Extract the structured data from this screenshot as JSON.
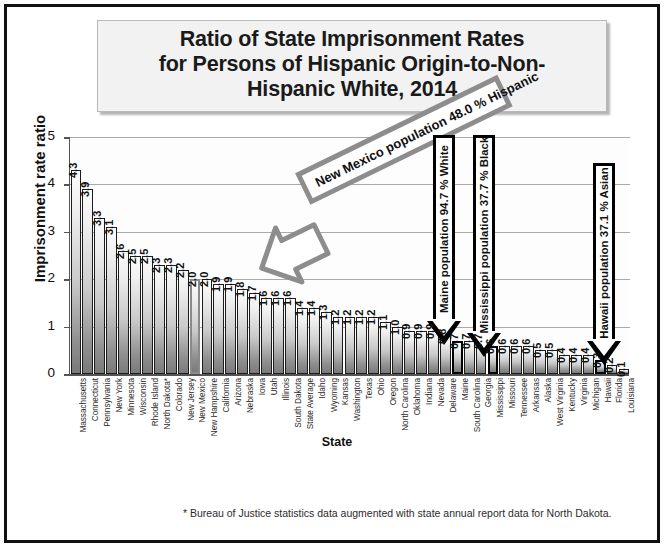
{
  "title": {
    "line1": "Ratio of State Imprisonment Rates",
    "line2": "for Persons of Hispanic Origin-to-Non-",
    "line3": "Hispanic White, 2014"
  },
  "footnote": "* Bureau of Justice statistics data augmented with state annual report data for North Dakota.",
  "annotations": {
    "new_mexico": "New Mexico population 48.0 % Hispanic",
    "maine": "Maine population 94.7 % White",
    "mississippi": "Mississippi population 37.7 % Black",
    "hawaii": "Hawaii population 37.1 % Asian"
  },
  "chart_data": {
    "type": "bar",
    "xlabel": "State",
    "ylabel": "Imprisonment rate ratio",
    "ylim": [
      0,
      5
    ],
    "yticks": [
      0,
      1,
      2,
      3,
      4,
      5
    ],
    "grid": true,
    "legend": "none",
    "categories": [
      "Massachusetts",
      "Connecticut",
      "Pennsylvania",
      "New York",
      "Minnesota",
      "Wisconsin",
      "Rhode Island",
      "North Dakota*",
      "Colorado",
      "New Jersey",
      "New Mexico",
      "New Hampshire",
      "California",
      "Arizona",
      "Nebraska",
      "Iowa",
      "Utah",
      "Illinois",
      "South Dakota",
      "State Average",
      "Idaho",
      "Wyoming",
      "Kansas",
      "Washington",
      "Texas",
      "Ohio",
      "Oregon",
      "North Carolina",
      "Oklahoma",
      "Indiana",
      "Nevada",
      "Delaware",
      "Maine",
      "South Carolina",
      "Georgia",
      "Mississippi",
      "Missouri",
      "Tennessee",
      "Arkansas",
      "Alaska",
      "West Virginia",
      "Kentucky",
      "Virginia",
      "Michigan",
      "Hawaii",
      "Florida",
      "Louisiana"
    ],
    "values": [
      4.3,
      3.9,
      3.3,
      3.1,
      2.6,
      2.5,
      2.5,
      2.3,
      2.3,
      2.2,
      2.0,
      2.0,
      1.9,
      1.9,
      1.8,
      1.7,
      1.6,
      1.6,
      1.6,
      1.4,
      1.4,
      1.3,
      1.2,
      1.2,
      1.2,
      1.2,
      1.1,
      1.0,
      0.9,
      0.9,
      0.9,
      0.8,
      0.7,
      0.7,
      0.7,
      0.6,
      0.6,
      0.6,
      0.6,
      0.5,
      0.5,
      0.4,
      0.4,
      0.4,
      0.3,
      0.2,
      0.1
    ],
    "highlighted": {
      "New Mexico": "gray-outline",
      "Maine": "black-outline",
      "Mississippi": "black-outline",
      "Hawaii": "black-outline"
    },
    "annotations": [
      "New Mexico population 48.0 % Hispanic",
      "Maine population 94.7 % White",
      "Mississippi population 37.7 % Black",
      "Hawaii population 37.1 % Asian"
    ]
  }
}
